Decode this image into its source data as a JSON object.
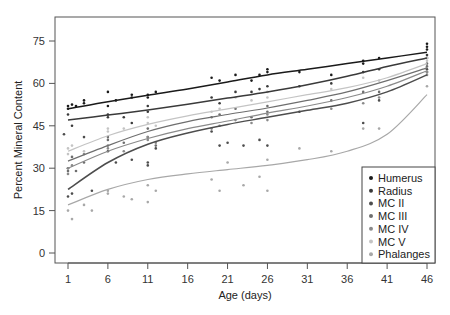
{
  "chart_data": {
    "type": "scatter",
    "subtype": "scatter with smoothed fit lines",
    "title": "",
    "xlabel": "Age (days)",
    "ylabel": "Percent Mineral Content",
    "xlim": [
      -1,
      48
    ],
    "ylim": [
      -4,
      83
    ],
    "x_ticks": [
      1,
      6,
      11,
      16,
      21,
      26,
      31,
      36,
      41,
      46
    ],
    "y_ticks": [
      0,
      15,
      30,
      45,
      60,
      75
    ],
    "grid": false,
    "legend_position": "bottom-right inside plot",
    "fit_x": [
      1,
      6,
      11,
      16,
      21,
      26,
      31,
      36,
      41,
      46
    ],
    "series": [
      {
        "name": "Humerus",
        "color": "#1a1a1a",
        "fit": [
          51,
          53.5,
          55.8,
          58,
          60.5,
          63,
          65,
          67,
          69,
          71
        ],
        "points": [
          [
            1,
            51
          ],
          [
            1,
            52
          ],
          [
            1.5,
            52.5
          ],
          [
            2,
            52
          ],
          [
            3,
            54
          ],
          [
            3,
            53
          ],
          [
            6,
            57
          ],
          [
            6,
            52
          ],
          [
            7,
            54
          ],
          [
            9,
            55
          ],
          [
            9,
            56
          ],
          [
            11,
            56
          ],
          [
            11,
            55
          ],
          [
            12,
            57
          ],
          [
            19,
            62
          ],
          [
            20,
            61
          ],
          [
            22,
            63
          ],
          [
            24,
            61
          ],
          [
            25,
            63
          ],
          [
            26,
            65
          ],
          [
            26,
            64
          ],
          [
            30,
            64
          ],
          [
            34,
            63
          ],
          [
            38,
            67
          ],
          [
            38,
            68
          ],
          [
            40,
            69
          ],
          [
            46,
            74
          ],
          [
            46,
            73
          ],
          [
            46,
            72
          ]
        ]
      },
      {
        "name": "Radius",
        "color": "#3a3a3a",
        "fit": [
          47,
          48.8,
          50.6,
          52.6,
          54.8,
          57,
          59.5,
          62.5,
          66,
          69
        ],
        "points": [
          [
            1,
            49
          ],
          [
            1.5,
            45
          ],
          [
            6,
            49
          ],
          [
            6,
            48
          ],
          [
            8,
            48
          ],
          [
            9,
            46
          ],
          [
            11,
            52
          ],
          [
            11,
            50
          ],
          [
            19,
            55
          ],
          [
            20,
            53
          ],
          [
            22,
            57
          ],
          [
            24,
            57
          ],
          [
            25,
            58
          ],
          [
            26,
            59
          ],
          [
            30,
            59
          ],
          [
            34,
            60
          ],
          [
            38,
            64
          ],
          [
            40,
            65
          ],
          [
            46,
            70
          ],
          [
            46,
            69
          ]
        ]
      },
      {
        "name": "MC II",
        "color": "#4d4d4d",
        "fit": [
          22.5,
          32,
          38.5,
          42.5,
          45.5,
          48,
          50.5,
          53,
          57,
          63
        ],
        "points": [
          [
            0.5,
            42
          ],
          [
            1,
            20
          ],
          [
            1.5,
            21
          ],
          [
            3,
            41
          ],
          [
            4,
            22
          ],
          [
            6,
            36
          ],
          [
            7,
            32
          ],
          [
            9,
            33
          ],
          [
            11,
            31
          ],
          [
            11,
            32
          ],
          [
            12,
            37
          ],
          [
            19,
            43
          ],
          [
            20,
            38
          ],
          [
            21,
            39
          ],
          [
            23,
            38
          ],
          [
            25,
            40
          ],
          [
            26,
            38
          ],
          [
            30,
            50
          ],
          [
            38,
            46
          ],
          [
            40,
            54
          ],
          [
            46,
            64
          ],
          [
            46,
            65
          ]
        ]
      },
      {
        "name": "MC III",
        "color": "#6e6e6e",
        "fit": [
          32.5,
          38,
          43,
          46.5,
          49,
          51.3,
          54,
          57,
          61,
          65.5
        ],
        "points": [
          [
            1,
            29
          ],
          [
            1,
            30
          ],
          [
            1.5,
            34
          ],
          [
            2,
            29
          ],
          [
            3,
            32
          ],
          [
            6,
            40
          ],
          [
            6,
            41
          ],
          [
            8,
            39
          ],
          [
            11,
            41
          ],
          [
            11,
            44
          ],
          [
            12,
            38
          ],
          [
            19,
            48
          ],
          [
            20,
            49
          ],
          [
            22,
            51
          ],
          [
            24,
            48
          ],
          [
            26,
            52
          ],
          [
            26,
            50
          ],
          [
            34,
            54
          ],
          [
            38,
            57
          ],
          [
            40,
            57
          ],
          [
            46,
            66
          ],
          [
            46,
            67
          ]
        ]
      },
      {
        "name": "MC IV",
        "color": "#8a8a8a",
        "fit": [
          30,
          36,
          40.5,
          44,
          46.7,
          49.5,
          52,
          55,
          59,
          64.5
        ],
        "points": [
          [
            1,
            28
          ],
          [
            1,
            30
          ],
          [
            1.5,
            31
          ],
          [
            3,
            35
          ],
          [
            6,
            38
          ],
          [
            6,
            37
          ],
          [
            8,
            36
          ],
          [
            11,
            40
          ],
          [
            11,
            41
          ],
          [
            12,
            39
          ],
          [
            19,
            44
          ],
          [
            20,
            45
          ],
          [
            22,
            47
          ],
          [
            24,
            46
          ],
          [
            26,
            47
          ],
          [
            26,
            49
          ],
          [
            34,
            51
          ],
          [
            38,
            53
          ],
          [
            40,
            55
          ],
          [
            46,
            64
          ],
          [
            46,
            63
          ]
        ]
      },
      {
        "name": "MC V",
        "color": "#c4c4c4",
        "fit": [
          36,
          41.5,
          45.5,
          48.5,
          51,
          53.5,
          56,
          58.5,
          62,
          67
        ],
        "points": [
          [
            1,
            35
          ],
          [
            1,
            37
          ],
          [
            1.5,
            38
          ],
          [
            3,
            36
          ],
          [
            6,
            43
          ],
          [
            6,
            44
          ],
          [
            8,
            44
          ],
          [
            11,
            46
          ],
          [
            11,
            48
          ],
          [
            12,
            45
          ],
          [
            19,
            50
          ],
          [
            20,
            51
          ],
          [
            22,
            55
          ],
          [
            24,
            54
          ],
          [
            26,
            55
          ],
          [
            26,
            57
          ],
          [
            34,
            58
          ],
          [
            38,
            62
          ],
          [
            40,
            61
          ],
          [
            46,
            68
          ],
          [
            46,
            69
          ]
        ]
      },
      {
        "name": "Phalanges",
        "color": "#a8a8a8",
        "fit": [
          17,
          22.5,
          26,
          28,
          29.5,
          31,
          33,
          36,
          42,
          56
        ],
        "points": [
          [
            1,
            15
          ],
          [
            1.5,
            12
          ],
          [
            3,
            17
          ],
          [
            4,
            15
          ],
          [
            6,
            22
          ],
          [
            6,
            21
          ],
          [
            8,
            20
          ],
          [
            9,
            19
          ],
          [
            11,
            24
          ],
          [
            11,
            18
          ],
          [
            12,
            22
          ],
          [
            19,
            26
          ],
          [
            20,
            22
          ],
          [
            21,
            32
          ],
          [
            23,
            24
          ],
          [
            25,
            27
          ],
          [
            26,
            22
          ],
          [
            26,
            33
          ],
          [
            30,
            37
          ],
          [
            34,
            36
          ],
          [
            38,
            44
          ],
          [
            40,
            44
          ],
          [
            46,
            59
          ]
        ]
      }
    ]
  }
}
